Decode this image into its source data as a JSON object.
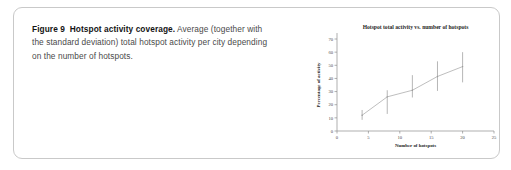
{
  "figure": {
    "label": "Figure 9",
    "title": "Hotspot activity coverage.",
    "caption_rest": " Average (together with the standard deviation) total hotspot activity per city depending on the number of hotspots.",
    "border_color": "#c9c9c9",
    "background_color": "#ffffff"
  },
  "chart_data": {
    "type": "line",
    "title": "Hotspot total activity vs. number of hotspots",
    "xlabel": "Number of hotspots",
    "ylabel": "Percentage of activity",
    "xlim": [
      0,
      25
    ],
    "ylim": [
      0,
      70
    ],
    "xticks": [
      0,
      5,
      10,
      15,
      20,
      25
    ],
    "yticks": [
      0,
      10,
      20,
      30,
      40,
      50,
      60,
      70
    ],
    "grid": false,
    "legend": "none",
    "series": [
      {
        "name": "Mean total hotspot activity",
        "x": [
          4,
          8,
          12,
          16,
          20
        ],
        "values": [
          12,
          26,
          31,
          41.5,
          49
        ],
        "error_low": [
          8.5,
          13,
          25.5,
          30.5,
          37
        ],
        "error_high": [
          16,
          31,
          42.5,
          53,
          60
        ],
        "line_color": "#a8a8a8",
        "error_color": "#a3a3a3"
      }
    ]
  }
}
